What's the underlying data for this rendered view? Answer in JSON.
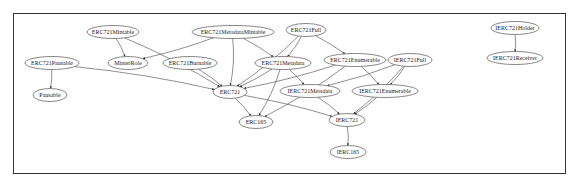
{
  "diagram": {
    "type": "inheritance-graph",
    "nodes": [
      {
        "id": "ERC721Mintable",
        "label": "ERC721Mintable",
        "x": 113,
        "y": 32,
        "rx": 26
      },
      {
        "id": "ERC721MetadataMintable",
        "label": "ERC721MetadataMintable",
        "x": 233,
        "y": 32,
        "rx": 41
      },
      {
        "id": "ERC721Full",
        "label": "ERC721Full",
        "x": 306,
        "y": 30,
        "rx": 20
      },
      {
        "id": "IERC721Holder",
        "label": "IERC721Holder",
        "x": 515,
        "y": 28,
        "rx": 24
      },
      {
        "id": "ERC721Pausable",
        "label": "ERC721Pausable",
        "x": 52,
        "y": 63,
        "rx": 27
      },
      {
        "id": "MinterRole",
        "label": "MinterRole",
        "x": 128,
        "y": 63,
        "rx": 20
      },
      {
        "id": "ERC721Burnable",
        "label": "ERC721Burnable",
        "x": 190,
        "y": 63,
        "rx": 27
      },
      {
        "id": "ERC721Metadata",
        "label": "ERC721Metadata",
        "x": 283,
        "y": 63,
        "rx": 28
      },
      {
        "id": "ERC721Enumerable",
        "label": "ERC721Enumerable",
        "x": 355,
        "y": 60,
        "rx": 31
      },
      {
        "id": "IERC721Full",
        "label": "IERC721Full",
        "x": 410,
        "y": 60,
        "rx": 22
      },
      {
        "id": "IERC721Receiver",
        "label": "IERC721Receiver",
        "x": 515,
        "y": 58,
        "rx": 28
      },
      {
        "id": "ERC721",
        "label": "ERC721",
        "x": 230,
        "y": 92,
        "rx": 17
      },
      {
        "id": "IERC721Metadata",
        "label": "IERC721Metadata",
        "x": 310,
        "y": 91,
        "rx": 30
      },
      {
        "id": "IERC721Enumerable",
        "label": "IERC721Enumerable",
        "x": 385,
        "y": 91,
        "rx": 33
      },
      {
        "id": "Pausable",
        "label": "Pausable",
        "x": 50,
        "y": 95,
        "rx": 17
      },
      {
        "id": "ERC165",
        "label": "ERC165",
        "x": 256,
        "y": 122,
        "rx": 17
      },
      {
        "id": "IERC721",
        "label": "IERC721",
        "x": 347,
        "y": 120,
        "rx": 18
      },
      {
        "id": "IERC165",
        "label": "IERC165",
        "x": 348,
        "y": 152,
        "rx": 18
      }
    ],
    "edges": [
      {
        "from": "ERC721Mintable",
        "to": "MinterRole"
      },
      {
        "from": "ERC721Mintable",
        "to": "ERC721"
      },
      {
        "from": "ERC721MetadataMintable",
        "to": "MinterRole"
      },
      {
        "from": "ERC721MetadataMintable",
        "to": "ERC721Metadata"
      },
      {
        "from": "ERC721MetadataMintable",
        "to": "ERC721"
      },
      {
        "from": "ERC721Full",
        "to": "ERC721Metadata"
      },
      {
        "from": "ERC721Full",
        "to": "ERC721Enumerable"
      },
      {
        "from": "ERC721Full",
        "to": "ERC721"
      },
      {
        "from": "ERC721Pausable",
        "to": "Pausable"
      },
      {
        "from": "ERC721Pausable",
        "to": "ERC721"
      },
      {
        "from": "ERC721Burnable",
        "to": "ERC721"
      },
      {
        "from": "ERC721Metadata",
        "to": "ERC721"
      },
      {
        "from": "ERC721Metadata",
        "to": "IERC721Metadata"
      },
      {
        "from": "ERC721Metadata",
        "to": "ERC165"
      },
      {
        "from": "ERC721Enumerable",
        "to": "ERC721"
      },
      {
        "from": "ERC721Enumerable",
        "to": "IERC721Enumerable"
      },
      {
        "from": "ERC721Enumerable",
        "to": "ERC165"
      },
      {
        "from": "IERC721Full",
        "to": "IERC721Metadata"
      },
      {
        "from": "IERC721Full",
        "to": "IERC721Enumerable"
      },
      {
        "from": "IERC721Full",
        "to": "IERC721"
      },
      {
        "from": "ERC721",
        "to": "ERC165"
      },
      {
        "from": "ERC721",
        "to": "IERC721"
      },
      {
        "from": "IERC721Metadata",
        "to": "IERC721"
      },
      {
        "from": "IERC721Enumerable",
        "to": "IERC721"
      },
      {
        "from": "IERC721",
        "to": "IERC165"
      },
      {
        "from": "IERC721Holder",
        "to": "IERC721Receiver"
      }
    ]
  }
}
